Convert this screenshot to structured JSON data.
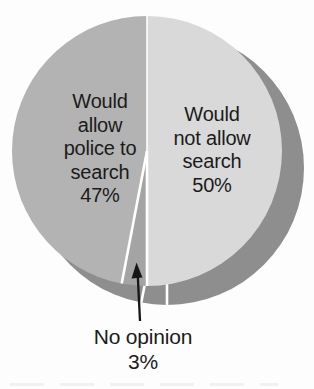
{
  "page": {
    "background": "#fdfdfd"
  },
  "chart_data": {
    "type": "pie",
    "title": "",
    "units": "percent",
    "total": 100,
    "direction": "clockwise",
    "start_angle_deg": 0,
    "labels_inside": true,
    "legend": "none",
    "slices": [
      {
        "label": "Would not allow search",
        "value": 50,
        "display": "Would\nnot allow\nsearch\n50%",
        "color": "#d9d9d9"
      },
      {
        "label": "No opinion",
        "value": 3,
        "display": "No opinion\n3%",
        "color": "#a4a4a4"
      },
      {
        "label": "Would allow police to search",
        "value": 47,
        "display": "Would\nallow\npolice to\nsearch\n47%",
        "color": "#b3b3b3"
      }
    ],
    "annotation": {
      "target_slice": "No opinion",
      "arrow": "up",
      "arrow_color": "#161616"
    },
    "shadow": {
      "color": "#8e8e8e",
      "offset_x": 20,
      "offset_y": 17
    },
    "separator_color": "#ffffff",
    "text_color": "#1b1b1b"
  }
}
